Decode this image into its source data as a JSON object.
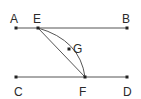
{
  "diagram": {
    "points": {
      "A": {
        "label": "A"
      },
      "B": {
        "label": "B"
      },
      "C": {
        "label": "C"
      },
      "D": {
        "label": "D"
      },
      "E": {
        "label": "E"
      },
      "F": {
        "label": "F"
      },
      "G": {
        "label": "G"
      }
    },
    "segments": [
      {
        "from": "A",
        "to": "B",
        "type": "line"
      },
      {
        "from": "C",
        "to": "D",
        "type": "line"
      },
      {
        "from": "E",
        "to": "F",
        "type": "line"
      },
      {
        "from": "E",
        "to": "F",
        "via": "G",
        "type": "curve"
      }
    ],
    "colors": {
      "line": "#555555",
      "point": "#222222",
      "label": "#2a2a2a"
    }
  }
}
